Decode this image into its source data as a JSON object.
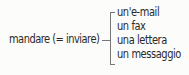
{
  "diagram": {
    "root": "mandare (= inviare)",
    "branches": [
      "un'e-mail",
      "un fax",
      "una lettera",
      "un messaggio"
    ],
    "colors": {
      "text": "#2a2a2a",
      "bracket": "#777777",
      "background": "#fcfcfb"
    }
  }
}
